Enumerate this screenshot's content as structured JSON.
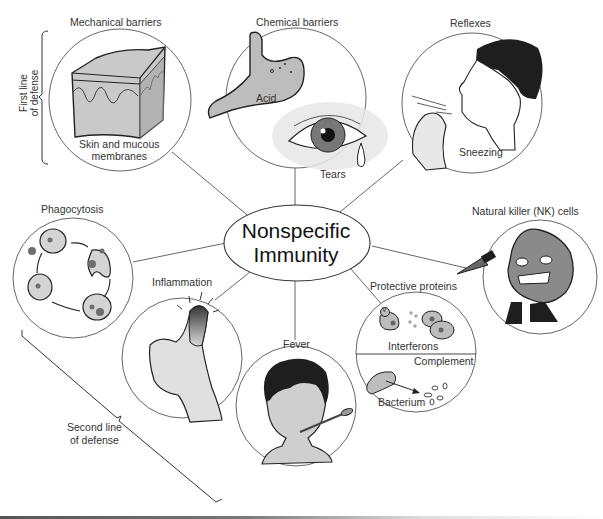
{
  "diagram": {
    "center": {
      "line1": "Nonspecific",
      "line2": "Immunity"
    },
    "groups": {
      "first_line": {
        "line1": "First line",
        "line2": "of defense"
      },
      "second_line": {
        "line1": "Second line",
        "line2": "of defense"
      }
    },
    "nodes": [
      {
        "id": "mechanical",
        "title": "Mechanical barriers",
        "caption_line1": "Skin and mucous",
        "caption_line2": "membranes"
      },
      {
        "id": "chemical",
        "title": "Chemical barriers",
        "sub_labels": [
          "Acid",
          "Tears"
        ]
      },
      {
        "id": "reflexes",
        "title": "Reflexes",
        "caption": "Sneezing"
      },
      {
        "id": "phagocytosis",
        "title": "Phagocytosis"
      },
      {
        "id": "nk",
        "title": "Natural killer (NK) cells"
      },
      {
        "id": "inflammation",
        "title": "Inflammation"
      },
      {
        "id": "fever",
        "title": "Fever"
      },
      {
        "id": "proteins",
        "title": "Protective proteins",
        "sub_labels": [
          "Interferons",
          "Complement",
          "Bacterium"
        ],
        "virus_mark": "V"
      }
    ],
    "colors": {
      "line": "#444444",
      "fill_gray": "#bdbdbd",
      "dark": "#1e1e1e",
      "skin": "#cfcfcf"
    }
  }
}
